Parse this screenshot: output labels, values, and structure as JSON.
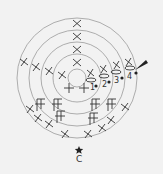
{
  "diagram": {
    "type": "crochet-chart",
    "rounds": [
      "1",
      "2",
      "3",
      "4"
    ],
    "start_label": "C",
    "colors": {
      "background": "#f2f2f2",
      "ring": "#9a9a9a",
      "stitch": "#333333"
    }
  }
}
